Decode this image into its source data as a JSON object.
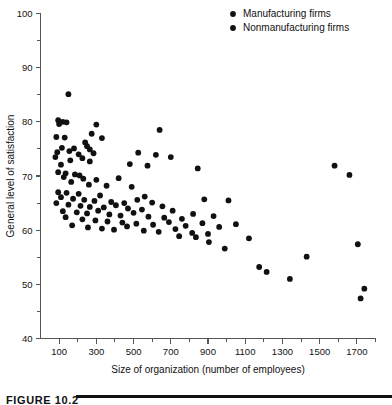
{
  "chart_data": {
    "type": "scatter",
    "title": "",
    "xlabel": "Size of organization (number of employees)",
    "ylabel": "General level of satisfaction",
    "xlim": [
      0,
      1800
    ],
    "ylim": [
      40,
      100
    ],
    "xticks": [
      100,
      300,
      500,
      700,
      900,
      1100,
      1300,
      1500,
      1700
    ],
    "xticklabels": [
      "100",
      "300",
      "500",
      "700",
      "900",
      "1100",
      "1300",
      "1500",
      "1700"
    ],
    "xminorticks": [
      200,
      400,
      600,
      800,
      1000,
      1200,
      1400,
      1600,
      1800
    ],
    "yticks": [
      40,
      50,
      60,
      70,
      80,
      90,
      100
    ],
    "yticklabels": [
      "40",
      "50",
      "60",
      "70",
      "80",
      "90",
      "100"
    ],
    "yminorticks": [
      45,
      55,
      65,
      75,
      85,
      95
    ],
    "grid": false,
    "legend_position": "top-right",
    "marker": "filled-circle",
    "marker_color": "#111111",
    "series": [
      {
        "name": "Manufacturing firms",
        "color": "#111111",
        "points": [
          [
            150,
            85.1
          ],
          [
            95,
            80.3
          ],
          [
            120,
            80.0
          ],
          [
            140,
            79.9
          ],
          [
            100,
            79.6
          ],
          [
            300,
            79.5
          ],
          [
            640,
            78.5
          ],
          [
            275,
            77.8
          ],
          [
            85,
            77.2
          ],
          [
            130,
            77.1
          ],
          [
            330,
            77.0
          ],
          [
            240,
            76.2
          ],
          [
            250,
            75.5
          ],
          [
            115,
            75.2
          ],
          [
            180,
            75.1
          ],
          [
            265,
            74.9
          ],
          [
            155,
            74.6
          ],
          [
            90,
            74.4
          ],
          [
            285,
            74.2
          ],
          [
            205,
            74.0
          ],
          [
            525,
            74.3
          ],
          [
            620,
            73.9
          ],
          [
            80,
            73.5
          ],
          [
            225,
            73.3
          ],
          [
            700,
            73.5
          ],
          [
            160,
            72.9
          ],
          [
            265,
            72.7
          ],
          [
            110,
            72.1
          ],
          [
            480,
            72.2
          ],
          [
            575,
            71.9
          ],
          [
            845,
            71.4
          ],
          [
            1580,
            71.9
          ],
          [
            95,
            70.7
          ],
          [
            135,
            70.5
          ],
          [
            185,
            70.3
          ],
          [
            210,
            70.1
          ],
          [
            1660,
            70.2
          ],
          [
            125,
            69.8
          ],
          [
            230,
            69.5
          ],
          [
            300,
            69.3
          ],
          [
            420,
            69.6
          ],
          [
            165,
            68.9
          ],
          [
            260,
            68.4
          ],
          [
            355,
            68.2
          ],
          [
            490,
            68.0
          ],
          [
            95,
            67.0
          ],
          [
            140,
            66.9
          ],
          [
            205,
            66.7
          ],
          [
            320,
            66.4
          ],
          [
            560,
            66.2
          ],
          [
            880,
            65.7
          ],
          [
            1010,
            65.5
          ]
        ]
      },
      {
        "name": "Nonmanufacturing firms",
        "color": "#111111",
        "points": [
          [
            110,
            66.1
          ],
          [
            175,
            65.8
          ],
          [
            235,
            65.6
          ],
          [
            290,
            65.4
          ],
          [
            380,
            65.2
          ],
          [
            450,
            65.0
          ],
          [
            520,
            65.6
          ],
          [
            600,
            65.1
          ],
          [
            85,
            65.0
          ],
          [
            150,
            64.7
          ],
          [
            215,
            64.5
          ],
          [
            265,
            64.3
          ],
          [
            340,
            64.2
          ],
          [
            405,
            64.6
          ],
          [
            470,
            64.0
          ],
          [
            545,
            63.8
          ],
          [
            655,
            64.4
          ],
          [
            710,
            63.6
          ],
          [
            120,
            63.5
          ],
          [
            195,
            63.3
          ],
          [
            250,
            63.1
          ],
          [
            310,
            63.6
          ],
          [
            370,
            62.9
          ],
          [
            430,
            62.7
          ],
          [
            500,
            63.2
          ],
          [
            580,
            62.5
          ],
          [
            665,
            62.3
          ],
          [
            760,
            62.1
          ],
          [
            820,
            63.0
          ],
          [
            930,
            62.6
          ],
          [
            135,
            62.4
          ],
          [
            225,
            62.0
          ],
          [
            295,
            61.8
          ],
          [
            360,
            61.6
          ],
          [
            440,
            61.4
          ],
          [
            515,
            61.2
          ],
          [
            605,
            61.0
          ],
          [
            690,
            61.5
          ],
          [
            780,
            60.8
          ],
          [
            870,
            61.3
          ],
          [
            960,
            60.6
          ],
          [
            1050,
            61.1
          ],
          [
            170,
            60.9
          ],
          [
            255,
            60.5
          ],
          [
            330,
            60.3
          ],
          [
            395,
            60.1
          ],
          [
            465,
            60.7
          ],
          [
            555,
            59.9
          ],
          [
            635,
            59.7
          ],
          [
            725,
            60.2
          ],
          [
            815,
            59.5
          ],
          [
            900,
            59.3
          ],
          [
            745,
            58.9
          ],
          [
            835,
            58.7
          ],
          [
            1120,
            58.5
          ],
          [
            905,
            57.8
          ],
          [
            1705,
            57.4
          ],
          [
            990,
            56.6
          ],
          [
            1430,
            55.1
          ],
          [
            1175,
            53.2
          ],
          [
            1215,
            52.3
          ],
          [
            1340,
            51.0
          ],
          [
            1740,
            49.2
          ],
          [
            1720,
            47.4
          ]
        ]
      }
    ]
  },
  "legend": {
    "entries": [
      {
        "label": "Manufacturing firms",
        "marker": "filled-circle"
      },
      {
        "label": "Nonmanufacturing firms",
        "marker": "filled-circle"
      }
    ]
  },
  "caption": {
    "text": "FIGURE 10.2"
  }
}
